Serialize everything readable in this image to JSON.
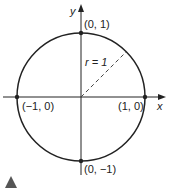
{
  "diagram": {
    "type": "unit-circle",
    "axes": {
      "x_label": "x",
      "y_label": "y"
    },
    "radius_label": "r = 1",
    "points": [
      {
        "label": "(0, 1)",
        "x": 0,
        "y": 1
      },
      {
        "label": "(1, 0)",
        "x": 1,
        "y": 0
      },
      {
        "label": "(−1, 0)",
        "x": -1,
        "y": 0
      },
      {
        "label": "(0, −1)",
        "x": 0,
        "y": -1
      }
    ],
    "colors": {
      "stroke": "#222222",
      "marker": "#555555"
    }
  }
}
